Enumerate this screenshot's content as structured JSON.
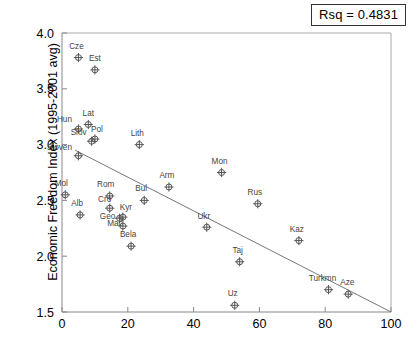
{
  "annotation": {
    "rsq_label": "Rsq = 0.4831"
  },
  "chart_data": {
    "type": "scatter",
    "title": "",
    "xlabel": "",
    "ylabel": "Economic Freedom Index (1995-2001 avg)",
    "xlim": [
      0,
      100
    ],
    "ylim": [
      1.5,
      4.0
    ],
    "xticks": [
      "0",
      "20",
      "40",
      "60",
      "80",
      "100"
    ],
    "xtick_values": [
      0,
      20,
      40,
      60,
      80,
      100
    ],
    "yticks": [
      "1.5",
      "2.0",
      "2.5",
      "3.0",
      "3.5",
      "4.0"
    ],
    "ytick_values": [
      1.5,
      2.0,
      2.5,
      3.0,
      3.5,
      4.0
    ],
    "grid": false,
    "legend": "none",
    "rsq": 0.4831,
    "trendline": {
      "type": "linear",
      "x0": 4.0,
      "y0": 2.95,
      "x1": 100.0,
      "y1": 1.5
    },
    "points": [
      {
        "label": "Cze",
        "x": 5.0,
        "y": 3.78,
        "lx": -2,
        "ly": -9
      },
      {
        "label": "Est",
        "x": 10.0,
        "y": 3.67,
        "lx": 0,
        "ly": -9
      },
      {
        "label": "Lat",
        "x": 8.0,
        "y": 3.18,
        "lx": 0,
        "ly": -9
      },
      {
        "label": "Hun",
        "x": 5.0,
        "y": 3.14,
        "lx": -14,
        "ly": -7
      },
      {
        "label": "Pol",
        "x": 10.0,
        "y": 3.05,
        "lx": 2,
        "ly": -7
      },
      {
        "label": "Slov",
        "x": 9.0,
        "y": 3.03,
        "lx": -13,
        "ly": -6
      },
      {
        "label": "Sloven",
        "x": 5.0,
        "y": 2.9,
        "lx": -19,
        "ly": -6
      },
      {
        "label": "Lith",
        "x": 23.5,
        "y": 3.0,
        "lx": -2,
        "ly": -9
      },
      {
        "label": "Mon",
        "x": 48.5,
        "y": 2.75,
        "lx": -2,
        "ly": -9
      },
      {
        "label": "Arm",
        "x": 32.5,
        "y": 2.62,
        "lx": -2,
        "ly": -9
      },
      {
        "label": "Mol",
        "x": 1.0,
        "y": 2.55,
        "lx": -4,
        "ly": -9
      },
      {
        "label": "Rom",
        "x": 14.5,
        "y": 2.54,
        "lx": -4,
        "ly": -9
      },
      {
        "label": "Bul",
        "x": 25.0,
        "y": 2.5,
        "lx": -3,
        "ly": -9
      },
      {
        "label": "Cro",
        "x": 14.5,
        "y": 2.43,
        "lx": -5,
        "ly": -6
      },
      {
        "label": "Rus",
        "x": 59.5,
        "y": 2.47,
        "lx": -3,
        "ly": -9
      },
      {
        "label": "Alb",
        "x": 5.5,
        "y": 2.37,
        "lx": -3,
        "ly": -9
      },
      {
        "label": "Kyr",
        "x": 18.5,
        "y": 2.35,
        "lx": 3,
        "ly": -7
      },
      {
        "label": "Geo",
        "x": 17.5,
        "y": 2.34,
        "lx": -12,
        "ly": 1
      },
      {
        "label": "Mac",
        "x": 18.5,
        "y": 2.27,
        "lx": -8,
        "ly": 0
      },
      {
        "label": "Ukr",
        "x": 44.0,
        "y": 2.26,
        "lx": -3,
        "ly": -8
      },
      {
        "label": "Kaz",
        "x": 72.0,
        "y": 2.14,
        "lx": -2,
        "ly": -9
      },
      {
        "label": "Bela",
        "x": 21.0,
        "y": 2.09,
        "lx": -3,
        "ly": -9
      },
      {
        "label": "Taj",
        "x": 54.0,
        "y": 1.95,
        "lx": -2,
        "ly": -9
      },
      {
        "label": "Turkmn",
        "x": 81.0,
        "y": 1.7,
        "lx": -6,
        "ly": -9
      },
      {
        "label": "Aze",
        "x": 87.0,
        "y": 1.66,
        "lx": -1,
        "ly": -9
      },
      {
        "label": "Uz",
        "x": 52.5,
        "y": 1.56,
        "lx": -2,
        "ly": -9
      }
    ]
  }
}
